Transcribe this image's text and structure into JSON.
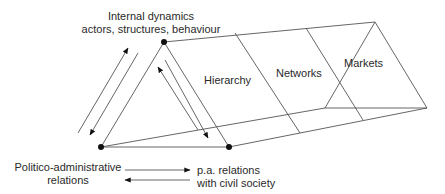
{
  "diagram": {
    "labels": {
      "internal_dynamics_line1": "Internal dynamics",
      "internal_dynamics_line2": "actors, structures, behaviour",
      "hierarchy": "Hierarchy",
      "networks": "Networks",
      "markets": "Markets",
      "politico_line1": "Politico-administrative",
      "politico_line2": "relations",
      "pa_line1": "p.a. relations",
      "pa_line2": "with civil society"
    },
    "nodes": [
      {
        "id": "internal-dynamics",
        "x": 164,
        "y": 42
      },
      {
        "id": "politico-administrative",
        "x": 101,
        "y": 147
      },
      {
        "id": "pa-civil-society",
        "x": 229,
        "y": 147
      }
    ],
    "sections": [
      "Hierarchy",
      "Networks",
      "Markets"
    ],
    "colors": {
      "line": "#555555",
      "node": "#111111",
      "text": "#2a2a2a"
    }
  }
}
